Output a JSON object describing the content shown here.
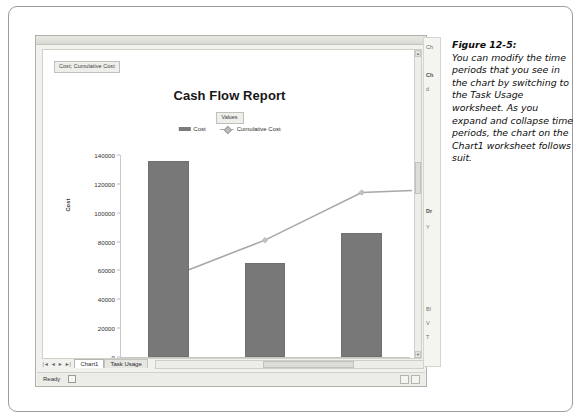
{
  "figure": {
    "label": "Figure 12-5:",
    "body": "You can modify the time periods that you see in the chart by switching to the Task Usage worksheet. As you expand and collapse time periods, the chart on the Chart1 worksheet follows suit."
  },
  "excel": {
    "field_button_series": "Cost; Cumulative Cost",
    "field_button_values": "Values",
    "sheet_tabs": [
      {
        "label": "Chart1",
        "active": true
      },
      {
        "label": "Task Usage",
        "active": false
      }
    ],
    "tab_nav": [
      "|◄",
      "◄",
      "►",
      "►|"
    ],
    "status": {
      "ready": "Ready",
      "icon": "sheet-icon"
    }
  },
  "task_pane": {
    "lines": [
      "Ch",
      "Ch",
      "d",
      "Dr",
      "Y",
      "Bl",
      "V",
      "T"
    ]
  },
  "chart_data": {
    "type": "bar",
    "title": "Cash Flow Report",
    "xlabel": "",
    "ylabel": "Cost",
    "categories": [
      "Remodel Project",
      "Remodel Project",
      "Remodel Project"
    ],
    "ylim": [
      0,
      140000
    ],
    "yticks": [
      0,
      20000,
      40000,
      60000,
      80000,
      100000,
      120000,
      140000
    ],
    "grid": false,
    "legend_position": "top",
    "series": [
      {
        "name": "Cost",
        "type": "bar",
        "color": "#787878",
        "values": [
          136000,
          65000,
          86000
        ]
      },
      {
        "name": "Cumulative Cost",
        "type": "line",
        "color": "#a8a8a8",
        "values": [
          55000,
          81000,
          114000
        ]
      }
    ]
  }
}
